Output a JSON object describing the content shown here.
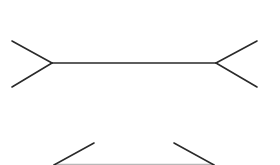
{
  "figure": {
    "background": "#ffffff",
    "stroke_color": "#2a2a2a",
    "bottom_shaft_color": "#b8b8b8",
    "stroke_width": 1.6,
    "top": {
      "shaft": {
        "x1": 52,
        "y1": 63,
        "x2": 216,
        "y2": 63
      },
      "fins": [
        {
          "x1": 12,
          "y1": 41,
          "x2": 52,
          "y2": 63
        },
        {
          "x1": 12,
          "y1": 87,
          "x2": 52,
          "y2": 63
        },
        {
          "x1": 257,
          "y1": 41,
          "x2": 216,
          "y2": 63
        },
        {
          "x1": 257,
          "y1": 87,
          "x2": 216,
          "y2": 63
        }
      ]
    },
    "bottom": {
      "shaft": {
        "x1": 54,
        "y1": 164.5,
        "x2": 214,
        "y2": 164.5
      },
      "fins": [
        {
          "x1": 54,
          "y1": 165,
          "x2": 94,
          "y2": 143
        },
        {
          "x1": 214,
          "y1": 165,
          "x2": 174,
          "y2": 143
        }
      ]
    }
  }
}
